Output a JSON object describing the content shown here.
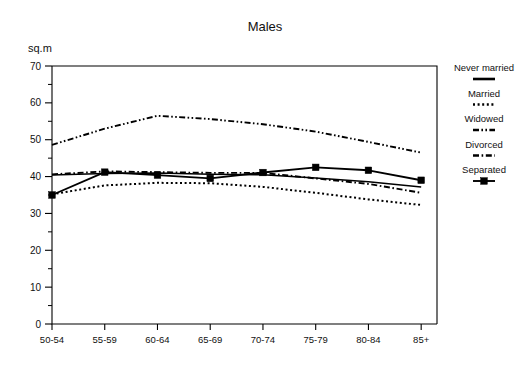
{
  "chart_data": {
    "type": "line",
    "title": "Males",
    "xlabel": "",
    "ylabel": "sq.m",
    "ylim": [
      0,
      70
    ],
    "ytick_step": 10,
    "yminor_step": 5,
    "grid": false,
    "legend_position": "right",
    "categories": [
      "50-54",
      "55-59",
      "60-64",
      "65-69",
      "70-74",
      "75-79",
      "80-84",
      "85+"
    ],
    "ytick_labels": [
      "0",
      "10",
      "20",
      "30",
      "40",
      "50",
      "60",
      "70"
    ],
    "series": [
      {
        "name": "Never married",
        "style": "solid",
        "marker": "none",
        "values": [
          40.4,
          40.8,
          41.0,
          40.6,
          40.5,
          39.6,
          38.6,
          37.2
        ]
      },
      {
        "name": "Married",
        "style": "dotted",
        "marker": "none",
        "values": [
          35.2,
          37.6,
          38.3,
          38.2,
          37.2,
          35.6,
          33.8,
          32.3
        ]
      },
      {
        "name": "Widowed",
        "style": "dash-dot-dot",
        "marker": "none",
        "values": [
          48.6,
          53.0,
          56.5,
          55.6,
          54.2,
          52.2,
          49.4,
          46.5
        ]
      },
      {
        "name": "Divorced",
        "style": "dash-dot",
        "marker": "none",
        "values": [
          40.6,
          41.4,
          41.2,
          41.0,
          41.0,
          39.5,
          38.0,
          35.6
        ]
      },
      {
        "name": "Separated",
        "style": "solid-marker",
        "marker": "square",
        "values": [
          35.0,
          41.2,
          40.4,
          39.5,
          41.1,
          42.5,
          41.7,
          39.0
        ]
      }
    ]
  },
  "legend": {
    "entries": [
      {
        "label": "Never married",
        "sample": "solid-line-sample"
      },
      {
        "label": "Married",
        "sample": "dotted-line-sample"
      },
      {
        "label": "Widowed",
        "sample": "dash-dot-dot-line-sample"
      },
      {
        "label": "Divorced",
        "sample": "dash-dot-line-sample"
      },
      {
        "label": "Separated",
        "sample": "square-marker-line-sample"
      }
    ]
  }
}
